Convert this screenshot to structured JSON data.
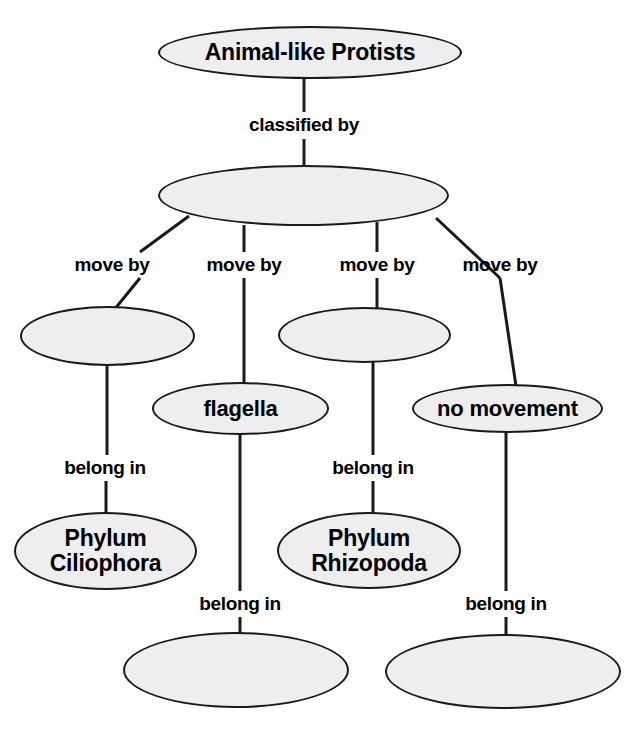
{
  "diagram": {
    "title_node": "Animal-like Protists",
    "background_color": "#ffffff",
    "node_fill_color": "#eeeeee",
    "node_border_color": "#1a1a1a",
    "text_color": "#000000",
    "nodes": [
      {
        "id": "root",
        "label": "Animal-like Protists",
        "x": 158,
        "y": 26,
        "w": 304,
        "h": 53,
        "font_size": 23,
        "empty": false
      },
      {
        "id": "classes",
        "label": "",
        "x": 158,
        "y": 165,
        "w": 291,
        "h": 61,
        "font_size": 21,
        "empty": true
      },
      {
        "id": "cilia",
        "label": "",
        "x": 20,
        "y": 306,
        "w": 175,
        "h": 60,
        "font_size": 21,
        "empty": true
      },
      {
        "id": "flagella",
        "label": "flagella",
        "x": 152,
        "y": 382,
        "w": 177,
        "h": 53,
        "font_size": 22,
        "empty": false
      },
      {
        "id": "pseudopods",
        "label": "",
        "x": 278,
        "y": 307,
        "w": 173,
        "h": 56,
        "font_size": 21,
        "empty": true
      },
      {
        "id": "no-movement",
        "label": "no movement",
        "x": 412,
        "y": 384,
        "w": 191,
        "h": 49,
        "font_size": 22,
        "empty": false
      },
      {
        "id": "ciliophora",
        "label": "Phylum\nCiliophora",
        "x": 14,
        "y": 512,
        "w": 183,
        "h": 78,
        "font_size": 23,
        "empty": false
      },
      {
        "id": "rhizopoda",
        "label": "Phylum\nRhizopoda",
        "x": 277,
        "y": 512,
        "w": 184,
        "h": 77,
        "font_size": 23,
        "empty": false
      },
      {
        "id": "zoomastigina",
        "label": "",
        "x": 123,
        "y": 632,
        "w": 226,
        "h": 76,
        "font_size": 21,
        "empty": true
      },
      {
        "id": "sporozoa",
        "label": "",
        "x": 385,
        "y": 634,
        "w": 236,
        "h": 75,
        "font_size": 21,
        "empty": true
      }
    ],
    "link_labels": [
      {
        "id": "classified-by",
        "text": "classified by",
        "x": 304,
        "y": 125
      },
      {
        "id": "move-by-1",
        "text": "move by",
        "x": 112,
        "y": 265
      },
      {
        "id": "move-by-2",
        "text": "move by",
        "x": 244,
        "y": 265
      },
      {
        "id": "move-by-3",
        "text": "move by",
        "x": 377,
        "y": 265
      },
      {
        "id": "move-by-4",
        "text": "move by",
        "x": 500,
        "y": 265
      },
      {
        "id": "belong-in-1",
        "text": "belong in",
        "x": 105,
        "y": 468
      },
      {
        "id": "belong-in-2",
        "text": "belong in",
        "x": 373,
        "y": 468
      },
      {
        "id": "belong-in-3",
        "text": "belong in",
        "x": 240,
        "y": 604
      },
      {
        "id": "belong-in-4",
        "text": "belong in",
        "x": 506,
        "y": 604
      }
    ],
    "edges": [
      {
        "id": "root-to-classes-upper",
        "x1": 304,
        "y1": 79,
        "x2": 304,
        "y2": 112
      },
      {
        "id": "root-to-classes-lower",
        "x1": 304,
        "y1": 139,
        "x2": 304,
        "y2": 166
      },
      {
        "id": "classes-to-movby1-up",
        "x1": 189,
        "y1": 216,
        "x2": 140,
        "y2": 252
      },
      {
        "id": "classes-to-movby2-up",
        "x1": 244,
        "y1": 225,
        "x2": 244,
        "y2": 252
      },
      {
        "id": "classes-to-movby3-up",
        "x1": 377,
        "y1": 222,
        "x2": 377,
        "y2": 252
      },
      {
        "id": "classes-to-movby4-up",
        "x1": 436,
        "y1": 218,
        "x2": 500,
        "y2": 278
      },
      {
        "id": "movby1-to-cilia",
        "x1": 140,
        "y1": 278,
        "x2": 114,
        "y2": 310
      },
      {
        "id": "movby2-to-flagella",
        "x1": 244,
        "y1": 278,
        "x2": 244,
        "y2": 383
      },
      {
        "id": "movby3-to-pseudopods",
        "x1": 377,
        "y1": 278,
        "x2": 377,
        "y2": 310
      },
      {
        "id": "movby4-to-nomovement",
        "x1": 500,
        "y1": 278,
        "x2": 516,
        "y2": 386
      },
      {
        "id": "cilia-to-belongin1",
        "x1": 107,
        "y1": 364,
        "x2": 107,
        "y2": 455
      },
      {
        "id": "belongin1-to-ciliophora",
        "x1": 106,
        "y1": 481,
        "x2": 106,
        "y2": 514
      },
      {
        "id": "pseudopods-to-belongin2",
        "x1": 373,
        "y1": 361,
        "x2": 373,
        "y2": 455
      },
      {
        "id": "belongin2-to-rhizopoda",
        "x1": 373,
        "y1": 481,
        "x2": 373,
        "y2": 514
      },
      {
        "id": "flagella-to-belongin3",
        "x1": 240,
        "y1": 434,
        "x2": 240,
        "y2": 591
      },
      {
        "id": "belongin3-to-zoomastigina",
        "x1": 240,
        "y1": 617,
        "x2": 240,
        "y2": 636
      },
      {
        "id": "nomovement-to-belongin4",
        "x1": 506,
        "y1": 432,
        "x2": 506,
        "y2": 591
      },
      {
        "id": "belongin4-to-sporozoa",
        "x1": 506,
        "y1": 617,
        "x2": 506,
        "y2": 638
      }
    ]
  }
}
